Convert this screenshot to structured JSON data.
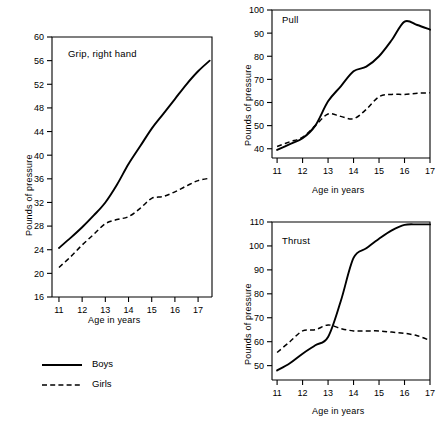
{
  "figure": {
    "legend": {
      "items": [
        {
          "label": "Boys",
          "style": "solid"
        },
        {
          "label": "Girls",
          "style": "dashed"
        }
      ]
    }
  },
  "chart_data": [
    {
      "type": "line",
      "title": "Grip, right hand",
      "xlabel": "Age in years",
      "ylabel": "Pounds of pressure",
      "xlim": [
        10.7,
        17.6
      ],
      "ylim": [
        16,
        60
      ],
      "xticks": [
        11,
        12,
        13,
        14,
        15,
        16,
        17
      ],
      "yticks": [
        16,
        20,
        24,
        28,
        32,
        36,
        40,
        44,
        48,
        52,
        56,
        60
      ],
      "grid": false,
      "legend_position": "below-figure",
      "series": [
        {
          "name": "Boys",
          "style": "solid",
          "x": [
            11.0,
            11.5,
            12.0,
            12.5,
            13.0,
            13.5,
            14.0,
            14.5,
            15.0,
            15.5,
            16.0,
            16.5,
            17.0,
            17.5
          ],
          "values": [
            24.3,
            26.0,
            27.8,
            29.8,
            32.0,
            35.0,
            38.5,
            41.5,
            44.5,
            47.0,
            49.5,
            52.0,
            54.2,
            56.0
          ]
        },
        {
          "name": "Girls",
          "style": "dashed",
          "x": [
            11.0,
            11.5,
            12.0,
            12.5,
            13.0,
            13.5,
            14.0,
            14.5,
            15.0,
            15.5,
            16.0,
            16.5,
            17.0,
            17.5
          ],
          "values": [
            21.0,
            22.8,
            24.8,
            26.6,
            28.4,
            29.1,
            29.6,
            31.0,
            32.7,
            33.0,
            33.8,
            34.8,
            35.7,
            36.1
          ]
        }
      ]
    },
    {
      "type": "line",
      "title": "Pull",
      "xlabel": "Age in years",
      "ylabel": "Pounds of pressure",
      "xlim": [
        10.8,
        17.0
      ],
      "ylim": [
        36,
        100
      ],
      "xticks": [
        11,
        12,
        13,
        14,
        15,
        16,
        17
      ],
      "yticks": [
        40,
        50,
        60,
        70,
        80,
        90,
        100
      ],
      "grid": false,
      "series": [
        {
          "name": "Boys",
          "style": "solid",
          "x": [
            11.0,
            11.5,
            12.0,
            12.5,
            13.0,
            13.5,
            14.0,
            14.5,
            15.0,
            15.5,
            16.0,
            16.5,
            17.0
          ],
          "values": [
            39.5,
            42.0,
            44.5,
            50.0,
            60.5,
            67.0,
            73.5,
            75.5,
            80.0,
            87.0,
            95.0,
            93.5,
            91.5
          ]
        },
        {
          "name": "Girls",
          "style": "dashed",
          "x": [
            11.0,
            11.5,
            12.0,
            12.5,
            13.0,
            13.5,
            14.0,
            14.5,
            15.0,
            15.5,
            16.0,
            16.5,
            17.0
          ],
          "values": [
            41.0,
            43.0,
            45.0,
            50.0,
            55.0,
            54.0,
            53.0,
            57.0,
            62.5,
            63.5,
            63.5,
            64.0,
            64.2
          ]
        }
      ]
    },
    {
      "type": "line",
      "title": "Thrust",
      "xlabel": "Age in years",
      "ylabel": "Pounds of pressure",
      "xlim": [
        10.8,
        17.0
      ],
      "ylim": [
        44,
        110
      ],
      "xticks": [
        11,
        12,
        13,
        14,
        15,
        16,
        17
      ],
      "yticks": [
        50,
        60,
        70,
        80,
        90,
        100,
        110
      ],
      "grid": false,
      "series": [
        {
          "name": "Boys",
          "style": "solid",
          "x": [
            11.0,
            11.5,
            12.0,
            12.5,
            13.0,
            13.5,
            14.0,
            14.5,
            15.0,
            15.5,
            16.0,
            16.5,
            17.0
          ],
          "values": [
            48.0,
            51.0,
            55.0,
            58.5,
            62.0,
            77.0,
            95.0,
            99.0,
            103.0,
            106.5,
            108.8,
            109.0,
            109.0
          ]
        },
        {
          "name": "Girls",
          "style": "dashed",
          "x": [
            11.0,
            11.5,
            12.0,
            12.5,
            13.0,
            13.5,
            14.0,
            14.5,
            15.0,
            15.5,
            16.0,
            16.5,
            17.0
          ],
          "values": [
            55.5,
            60.0,
            64.5,
            65.0,
            67.0,
            65.5,
            64.5,
            64.5,
            64.5,
            64.0,
            63.5,
            62.5,
            60.5
          ]
        }
      ]
    }
  ]
}
